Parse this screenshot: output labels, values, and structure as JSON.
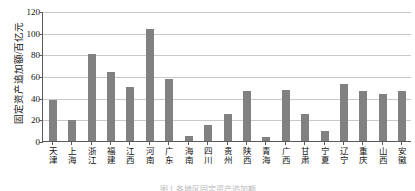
{
  "chart_data": {
    "type": "bar",
    "title": "",
    "subtitle": "",
    "xlabel": "",
    "ylabel": "固定资产追加额/百亿元",
    "ylim": [
      0,
      120
    ],
    "yticks": [
      0,
      20,
      40,
      60,
      80,
      100,
      120
    ],
    "grid": true,
    "legend": null,
    "bar_color": "#818181",
    "axis_color": "#5a5a5a",
    "grid_color": "#c9c9c9",
    "categories": [
      "天津",
      "上海",
      "浙江",
      "福建",
      "江西",
      "河南",
      "广东",
      "海南",
      "四川",
      "贵州",
      "陕西",
      "青海",
      "广西",
      "甘肃",
      "宁夏",
      "辽宁",
      "重庆",
      "山西",
      "安徽"
    ],
    "values": [
      38,
      19,
      80,
      64,
      50,
      103,
      57,
      5,
      15,
      25,
      46,
      4,
      47,
      25,
      9,
      53,
      46,
      43,
      46
    ]
  },
  "caption": {
    "text": "图 1   各地区固定资产追加额"
  }
}
